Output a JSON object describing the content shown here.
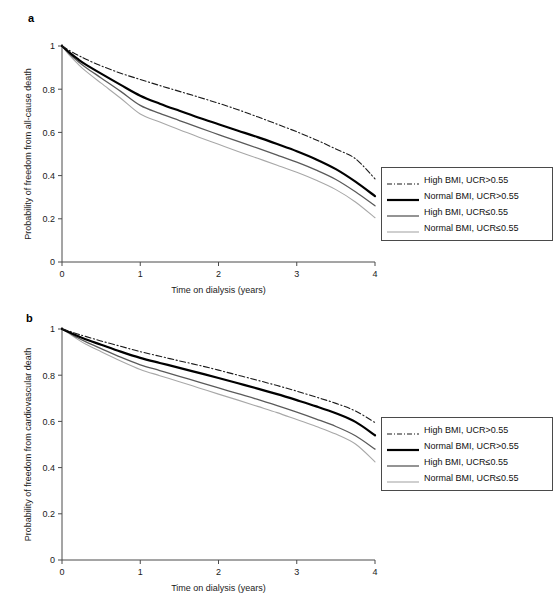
{
  "figure": {
    "panels": [
      {
        "id": "a",
        "label": "a",
        "ylabel": "Probability of freedom from all-cause death",
        "xlabel": "Time on dialysis (years)"
      },
      {
        "id": "b",
        "label": "b",
        "ylabel": "Probability of freedom from cardiovascular death",
        "xlabel": "Time on dialysis (years)"
      }
    ],
    "legend": {
      "entries": [
        {
          "label": "High BMI, UCR>0.55",
          "style": "dash-dot",
          "color": "#1a1a1a",
          "width": 1.1
        },
        {
          "label": "Normal BMI, UCR>0.55",
          "style": "solid",
          "color": "#000000",
          "width": 2.2
        },
        {
          "label": "High BMI, UCR≤0.55",
          "style": "solid",
          "color": "#5a5a5a",
          "width": 1.3
        },
        {
          "label": "Normal BMI, UCR≤0.55",
          "style": "solid",
          "color": "#a8a8a8",
          "width": 1.1
        }
      ]
    }
  },
  "chart_data": [
    {
      "type": "line",
      "panel": "a",
      "title": "",
      "xlabel": "Time on dialysis (years)",
      "ylabel": "Probability of freedom from all-cause death",
      "xlim": [
        0,
        4
      ],
      "ylim": [
        0,
        1
      ],
      "xticks": [
        0,
        1,
        2,
        3,
        4
      ],
      "xticklabels": [
        "0",
        "1",
        "2",
        "3",
        "4"
      ],
      "yticks": [
        0,
        0.2,
        0.4,
        0.6,
        0.8,
        1
      ],
      "yticklabels": [
        "0",
        "0.2",
        "0.4",
        "0.6",
        "0.8",
        "1"
      ],
      "grid": false,
      "legend_position": "right",
      "x": [
        0,
        0.1,
        0.2,
        0.3,
        0.5,
        0.75,
        1,
        1.25,
        1.5,
        1.75,
        2,
        2.25,
        2.5,
        2.75,
        3,
        3.25,
        3.5,
        3.75,
        4
      ],
      "series": [
        {
          "name": "High BMI, UCR>0.55",
          "values": [
            1,
            0.978,
            0.958,
            0.94,
            0.908,
            0.874,
            0.845,
            0.817,
            0.79,
            0.763,
            0.735,
            0.705,
            0.672,
            0.638,
            0.603,
            0.565,
            0.523,
            0.478,
            0.385
          ]
        },
        {
          "name": "Normal BMI, UCR>0.55",
          "values": [
            1,
            0.968,
            0.94,
            0.915,
            0.872,
            0.82,
            0.77,
            0.733,
            0.7,
            0.668,
            0.638,
            0.608,
            0.578,
            0.546,
            0.513,
            0.475,
            0.43,
            0.372,
            0.305
          ]
        },
        {
          "name": "High BMI, UCR≤0.55",
          "values": [
            1,
            0.962,
            0.93,
            0.902,
            0.852,
            0.79,
            0.725,
            0.688,
            0.655,
            0.622,
            0.59,
            0.558,
            0.527,
            0.495,
            0.462,
            0.425,
            0.382,
            0.325,
            0.26
          ]
        },
        {
          "name": "Normal BMI, UCR≤0.55",
          "values": [
            1,
            0.955,
            0.918,
            0.885,
            0.828,
            0.758,
            0.685,
            0.648,
            0.612,
            0.578,
            0.545,
            0.512,
            0.48,
            0.448,
            0.415,
            0.378,
            0.335,
            0.278,
            0.205
          ]
        }
      ]
    },
    {
      "type": "line",
      "panel": "b",
      "title": "",
      "xlabel": "Time on dialysis (years)",
      "ylabel": "Probability of freedom from cardiovascular death",
      "xlim": [
        0,
        4
      ],
      "ylim": [
        0,
        1
      ],
      "xticks": [
        0,
        1,
        2,
        3,
        4
      ],
      "xticklabels": [
        "0",
        "1",
        "2",
        "3",
        "4"
      ],
      "yticks": [
        0,
        0.2,
        0.4,
        0.6,
        0.8,
        1
      ],
      "yticklabels": [
        "0",
        "0.2",
        "0.4",
        "0.6",
        "0.8",
        "1"
      ],
      "grid": false,
      "legend_position": "right",
      "x": [
        0,
        0.1,
        0.2,
        0.3,
        0.5,
        0.75,
        1,
        1.25,
        1.5,
        1.75,
        2,
        2.25,
        2.5,
        2.75,
        3,
        3.25,
        3.5,
        3.75,
        4
      ],
      "series": [
        {
          "name": "High BMI, UCR>0.55",
          "values": [
            1,
            0.99,
            0.978,
            0.968,
            0.948,
            0.925,
            0.902,
            0.882,
            0.862,
            0.843,
            0.822,
            0.8,
            0.778,
            0.755,
            0.731,
            0.705,
            0.678,
            0.645,
            0.595
          ]
        },
        {
          "name": "Normal BMI, UCR>0.55",
          "values": [
            1,
            0.985,
            0.97,
            0.956,
            0.932,
            0.902,
            0.875,
            0.853,
            0.832,
            0.81,
            0.788,
            0.765,
            0.742,
            0.718,
            0.692,
            0.665,
            0.635,
            0.598,
            0.54
          ]
        },
        {
          "name": "High BMI, UCR≤0.55",
          "values": [
            1,
            0.982,
            0.962,
            0.945,
            0.915,
            0.878,
            0.845,
            0.82,
            0.795,
            0.77,
            0.745,
            0.72,
            0.695,
            0.668,
            0.64,
            0.61,
            0.578,
            0.538,
            0.48
          ]
        },
        {
          "name": "Normal BMI, UCR≤0.55",
          "values": [
            1,
            0.978,
            0.955,
            0.935,
            0.902,
            0.862,
            0.825,
            0.798,
            0.772,
            0.745,
            0.718,
            0.692,
            0.665,
            0.638,
            0.608,
            0.578,
            0.545,
            0.502,
            0.425
          ]
        }
      ]
    }
  ]
}
